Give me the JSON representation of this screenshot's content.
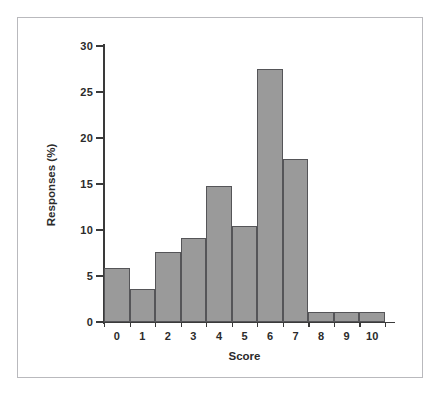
{
  "figure": {
    "frame_color": "#b9b9bd",
    "background": "#ffffff",
    "caption": ""
  },
  "chart_data": {
    "type": "bar",
    "title": "",
    "subtitle": "",
    "xlabel": "Score",
    "ylabel": "Responses (%)",
    "categories": [
      "0",
      "1",
      "2",
      "3",
      "4",
      "5",
      "6",
      "7",
      "8",
      "9",
      "10"
    ],
    "values": [
      5.9,
      3.6,
      7.6,
      9.1,
      14.8,
      10.4,
      27.5,
      17.7,
      1.1,
      1.1,
      1.1
    ],
    "xlim": [
      0,
      11
    ],
    "ylim": [
      0,
      30
    ],
    "yticks": [
      0,
      5,
      10,
      15,
      20,
      25,
      30
    ],
    "ytick_labels": [
      "0",
      "5",
      "10",
      "15",
      "20",
      "25",
      "30"
    ],
    "xtick_labels": [
      "0",
      "1",
      "2",
      "3",
      "4",
      "5",
      "6",
      "7",
      "8",
      "9",
      "10"
    ],
    "grid": false,
    "legend": null,
    "legend_position": "none",
    "bar_fill_color": "#9a9a9a",
    "bar_edge_color": "#555558",
    "axis_color": "#3a3a3a",
    "annotations": []
  }
}
